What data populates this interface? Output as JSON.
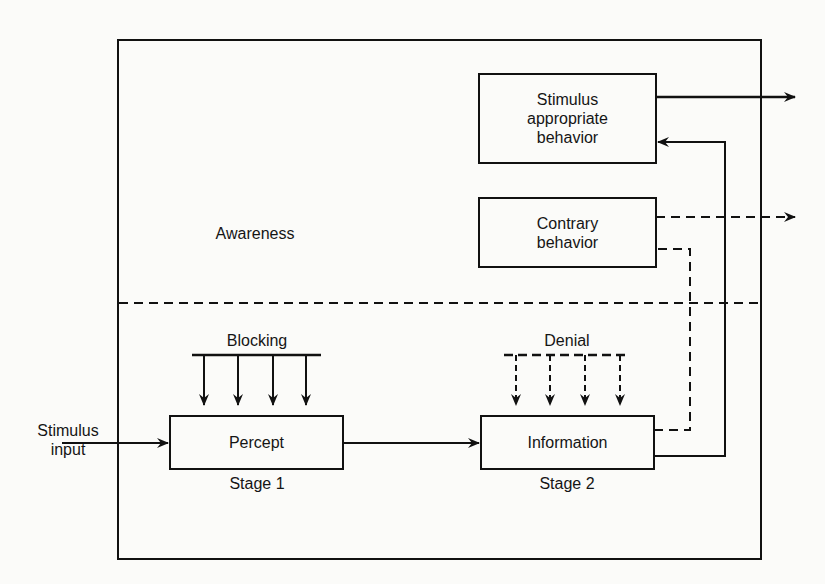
{
  "diagram": {
    "regions": {
      "awareness": "Awareness"
    },
    "boxes": {
      "stimulus_appropriate": [
        "Stimulus",
        "appropriate",
        "behavior"
      ],
      "contrary": [
        "Contrary",
        "behavior"
      ],
      "percept": "Percept",
      "information": "Information"
    },
    "stage_labels": {
      "stage1": "Stage 1",
      "stage2": "Stage 2"
    },
    "filters": {
      "blocking": "Blocking",
      "denial": "Denial"
    },
    "input": [
      "Stimulus",
      "input"
    ],
    "colors": {
      "ink": "#111111",
      "background": "#fbfbf9"
    }
  }
}
